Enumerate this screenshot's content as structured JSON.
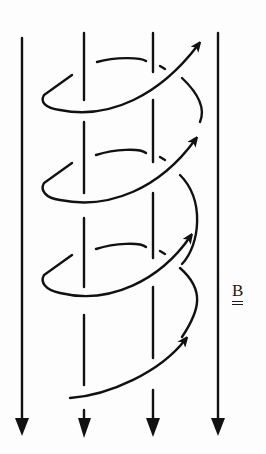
{
  "diagram": {
    "field_label": "B",
    "field_label_underline": "double",
    "colors": {
      "ink": "#111111",
      "background": "#fdfdfd"
    },
    "field_lines": [
      {
        "x": 22,
        "direction": "down"
      },
      {
        "x": 84,
        "direction": "down"
      },
      {
        "x": 153,
        "direction": "down"
      },
      {
        "x": 218,
        "direction": "down"
      }
    ],
    "helix_turns": 3.5,
    "helix_direction": "upward"
  }
}
